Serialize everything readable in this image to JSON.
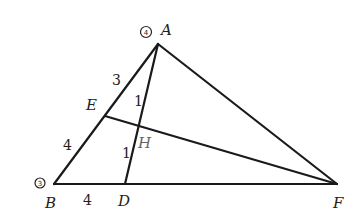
{
  "diagram": {
    "type": "geometry-triangle",
    "points": {
      "A": {
        "label": "A",
        "x": 158,
        "y": 44,
        "marker": "4"
      },
      "B": {
        "label": "B",
        "x": 54,
        "y": 184,
        "marker": "3"
      },
      "D": {
        "label": "D",
        "x": 125,
        "y": 184
      },
      "E": {
        "label": "E",
        "x": 105,
        "y": 116
      },
      "F": {
        "label": "F",
        "x": 337,
        "y": 184
      },
      "H": {
        "label": "H",
        "x": 139,
        "y": 126
      }
    },
    "segments": [
      {
        "from": "A",
        "to": "B"
      },
      {
        "from": "B",
        "to": "F"
      },
      {
        "from": "A",
        "to": "F"
      },
      {
        "from": "A",
        "to": "D"
      },
      {
        "from": "E",
        "to": "F"
      }
    ],
    "segment_labels": {
      "AE": "3",
      "EB": "4",
      "AH": "1",
      "HD": "1",
      "BD": "4"
    }
  }
}
